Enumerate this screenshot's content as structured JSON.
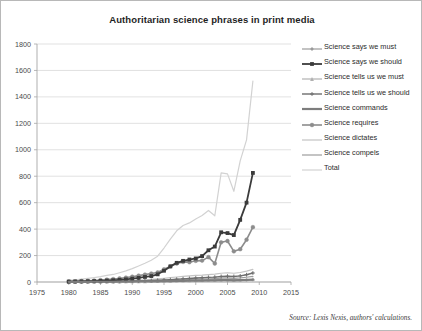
{
  "figure": {
    "title": "Authoritarian science phrases in print media",
    "source_note": "Source: Lexis Nexis, authors' calculations.",
    "border_color": "#b8b8b8",
    "background_color": "#ffffff",
    "gridline_color": "#d9d9d9",
    "axis_color": "#a6a6a6"
  },
  "legend": {
    "position": "right",
    "items": [
      {
        "label": "Science says we must",
        "color": "#9a9a9a",
        "marker": "diamond",
        "width": 1.2
      },
      {
        "label": "Science says we should",
        "color": "#3b3b3b",
        "marker": "square",
        "width": 1.8
      },
      {
        "label": "Science tells us we must",
        "color": "#b0b0b0",
        "marker": "triangle",
        "width": 1.2
      },
      {
        "label": "Science tells us we should",
        "color": "#6e6e6e",
        "marker": "cross",
        "width": 1.4
      },
      {
        "label": "Science commands",
        "color": "#7d7d7d",
        "marker": "none",
        "width": 2.2
      },
      {
        "label": "Science requires",
        "color": "#8c8c8c",
        "marker": "circle",
        "width": 1.6
      },
      {
        "label": "Science dictates",
        "color": "#c4c4c4",
        "marker": "none",
        "width": 1.2
      },
      {
        "label": "Science compels",
        "color": "#9d9d9d",
        "marker": "none",
        "width": 1.2
      },
      {
        "label": "Total",
        "color": "#d2d2d2",
        "marker": "none",
        "width": 1.2
      }
    ]
  },
  "chart_data": {
    "type": "line",
    "title": "Authoritarian science phrases in print media",
    "xlabel": "",
    "ylabel": "",
    "xlim": [
      1975,
      2015
    ],
    "ylim": [
      0,
      1800
    ],
    "xticks": [
      1975,
      1980,
      1985,
      1990,
      1995,
      2000,
      2005,
      2010,
      2015
    ],
    "yticks": [
      0,
      200,
      400,
      600,
      800,
      1000,
      1200,
      1400,
      1600,
      1800
    ],
    "grid": "horizontal",
    "legend_position": "right",
    "x": [
      1980,
      1981,
      1982,
      1983,
      1984,
      1985,
      1986,
      1987,
      1988,
      1989,
      1990,
      1991,
      1992,
      1993,
      1994,
      1995,
      1996,
      1997,
      1998,
      1999,
      2000,
      2001,
      2002,
      2003,
      2004,
      2005,
      2006,
      2007,
      2008,
      2009
    ],
    "series": [
      {
        "name": "Science says we must",
        "values": [
          1,
          1,
          2,
          2,
          2,
          3,
          3,
          3,
          4,
          4,
          5,
          5,
          6,
          6,
          7,
          8,
          9,
          10,
          11,
          12,
          13,
          13,
          14,
          14,
          15,
          15,
          14,
          15,
          16,
          18
        ]
      },
      {
        "name": "Science says we should",
        "values": [
          3,
          4,
          5,
          6,
          7,
          9,
          11,
          13,
          16,
          20,
          25,
          31,
          38,
          45,
          58,
          85,
          118,
          145,
          160,
          170,
          178,
          196,
          240,
          268,
          376,
          370,
          355,
          470,
          600,
          825
        ]
      },
      {
        "name": "Science tells us we must",
        "values": [
          1,
          1,
          1,
          2,
          2,
          2,
          3,
          3,
          3,
          4,
          4,
          5,
          5,
          6,
          7,
          8,
          9,
          10,
          12,
          13,
          14,
          15,
          16,
          17,
          18,
          18,
          17,
          18,
          20,
          22
        ]
      },
      {
        "name": "Science tells us we should",
        "values": [
          1,
          1,
          2,
          2,
          3,
          3,
          4,
          4,
          5,
          6,
          7,
          8,
          9,
          11,
          13,
          15,
          18,
          21,
          24,
          27,
          30,
          32,
          35,
          37,
          42,
          44,
          42,
          46,
          55,
          68
        ]
      },
      {
        "name": "Science commands",
        "values": [
          1,
          1,
          1,
          1,
          2,
          2,
          2,
          2,
          3,
          3,
          3,
          4,
          4,
          5,
          5,
          6,
          7,
          8,
          9,
          10,
          11,
          11,
          12,
          13,
          14,
          14,
          13,
          14,
          15,
          17
        ]
      },
      {
        "name": "Science requires",
        "values": [
          4,
          5,
          7,
          9,
          11,
          14,
          18,
          22,
          27,
          33,
          40,
          48,
          56,
          64,
          72,
          96,
          118,
          140,
          152,
          150,
          160,
          162,
          188,
          140,
          300,
          310,
          232,
          248,
          320,
          415
        ]
      },
      {
        "name": "Science dictates",
        "values": [
          2,
          2,
          3,
          3,
          4,
          5,
          6,
          7,
          8,
          10,
          12,
          14,
          17,
          20,
          24,
          28,
          33,
          38,
          42,
          46,
          50,
          52,
          56,
          60,
          66,
          70,
          66,
          72,
          82,
          95
        ]
      },
      {
        "name": "Science compels",
        "values": [
          1,
          1,
          1,
          2,
          2,
          2,
          3,
          3,
          4,
          4,
          5,
          6,
          7,
          8,
          9,
          11,
          13,
          15,
          17,
          19,
          21,
          22,
          24,
          26,
          29,
          30,
          28,
          31,
          36,
          42
        ]
      },
      {
        "name": "Total",
        "values": [
          14,
          16,
          22,
          27,
          33,
          40,
          50,
          57,
          70,
          84,
          101,
          121,
          142,
          165,
          195,
          257,
          325,
          387,
          427,
          447,
          477,
          503,
          541,
          501,
          825,
          818,
          686,
          916,
          1075,
          1520
        ]
      }
    ]
  }
}
